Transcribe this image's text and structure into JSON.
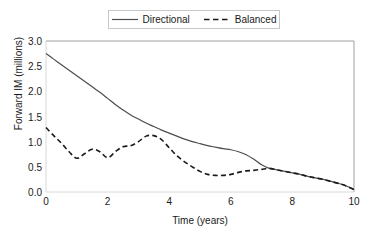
{
  "chart_data": {
    "type": "line",
    "title": "",
    "xlabel": "Time (years)",
    "ylabel": "Forward IM (millions)",
    "xlim": [
      0,
      10
    ],
    "ylim": [
      0,
      3.0
    ],
    "xticks": [
      "0",
      "2",
      "4",
      "6",
      "8",
      "10"
    ],
    "xtick_values": [
      0,
      2,
      4,
      6,
      8,
      10
    ],
    "yticks": [
      "0.0",
      "0.5",
      "1.0",
      "1.5",
      "2.0",
      "2.5",
      "3.0"
    ],
    "ytick_values": [
      0.0,
      0.5,
      1.0,
      1.5,
      2.0,
      2.5,
      3.0
    ],
    "grid": false,
    "legend_position": "top-center",
    "series": [
      {
        "name": "Directional",
        "style": "solid",
        "color": "#4d4d4d",
        "x": [
          0.0,
          0.25,
          0.5,
          0.75,
          1.0,
          1.25,
          1.5,
          1.75,
          2.0,
          2.25,
          2.5,
          2.75,
          3.0,
          3.25,
          3.5,
          3.75,
          4.0,
          4.25,
          4.5,
          4.75,
          5.0,
          5.25,
          5.5,
          5.75,
          6.0,
          6.25,
          6.5,
          6.75,
          7.0,
          7.25,
          7.5,
          7.75,
          8.0,
          8.25,
          8.5,
          8.75,
          9.0,
          9.25,
          9.5,
          9.75,
          10.0
        ],
        "y": [
          2.75,
          2.64,
          2.53,
          2.42,
          2.31,
          2.2,
          2.09,
          1.98,
          1.86,
          1.74,
          1.63,
          1.53,
          1.45,
          1.37,
          1.3,
          1.23,
          1.17,
          1.11,
          1.05,
          1.0,
          0.96,
          0.92,
          0.89,
          0.86,
          0.84,
          0.8,
          0.74,
          0.65,
          0.54,
          0.47,
          0.44,
          0.41,
          0.38,
          0.35,
          0.31,
          0.28,
          0.25,
          0.21,
          0.17,
          0.12,
          0.05
        ]
      },
      {
        "name": "Balanced",
        "style": "dashed",
        "color": "#1a1a1a",
        "x": [
          0.0,
          0.25,
          0.5,
          0.75,
          1.0,
          1.25,
          1.5,
          1.75,
          2.0,
          2.25,
          2.5,
          2.75,
          3.0,
          3.25,
          3.5,
          3.75,
          4.0,
          4.25,
          4.5,
          4.75,
          5.0,
          5.25,
          5.5,
          5.75,
          6.0,
          6.25,
          6.5,
          6.75,
          7.0,
          7.25,
          7.5,
          7.75,
          8.0,
          8.25,
          8.5,
          8.75,
          9.0,
          9.25,
          9.5,
          9.75,
          10.0
        ],
        "y": [
          1.28,
          1.12,
          0.97,
          0.8,
          0.67,
          0.76,
          0.85,
          0.8,
          0.68,
          0.8,
          0.9,
          0.92,
          1.0,
          1.11,
          1.12,
          1.04,
          0.88,
          0.72,
          0.6,
          0.5,
          0.41,
          0.35,
          0.33,
          0.33,
          0.35,
          0.39,
          0.42,
          0.43,
          0.45,
          0.47,
          0.44,
          0.41,
          0.38,
          0.35,
          0.31,
          0.28,
          0.25,
          0.21,
          0.17,
          0.12,
          0.05
        ]
      }
    ]
  },
  "legend": {
    "entries": [
      {
        "label": "Directional"
      },
      {
        "label": "Balanced"
      }
    ]
  }
}
